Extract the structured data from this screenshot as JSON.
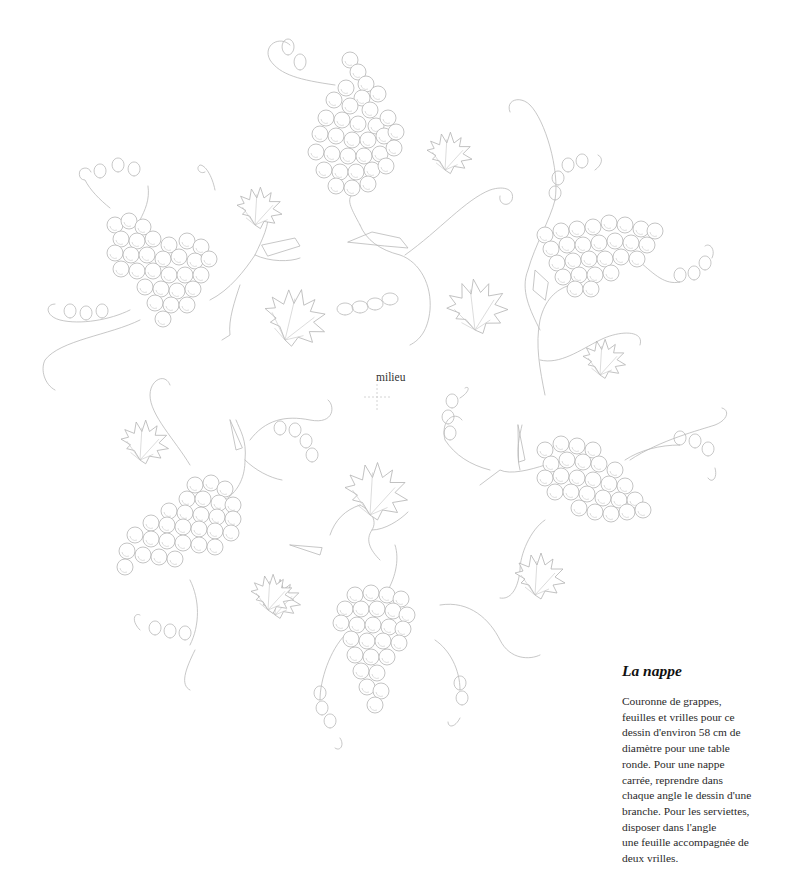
{
  "page": {
    "center_label": "milieu",
    "caption": {
      "title": "La nappe",
      "lines": [
        "Couronne de grappes,",
        "feuilles et vrilles pour ce",
        "dessin d'environ 58 cm de",
        "diamètre pour une table",
        "ronde. Pour une nappe",
        "carrée, reprendre dans",
        "chaque angle le dessin d'une",
        "branche. Pour les serviettes,",
        "disposer dans l'angle",
        "une feuille accompagnée de",
        "deux vrilles."
      ]
    }
  },
  "illustration": {
    "subject": "grape-vine wreath embroidery pattern",
    "motifs": [
      {
        "type": "grape-cluster",
        "position": "top"
      },
      {
        "type": "grape-cluster",
        "position": "upper-left"
      },
      {
        "type": "grape-cluster",
        "position": "upper-right"
      },
      {
        "type": "grape-cluster",
        "position": "lower-left"
      },
      {
        "type": "grape-cluster",
        "position": "lower-right"
      },
      {
        "type": "grape-cluster",
        "position": "bottom"
      }
    ],
    "line_color": "#b9b9b9"
  }
}
